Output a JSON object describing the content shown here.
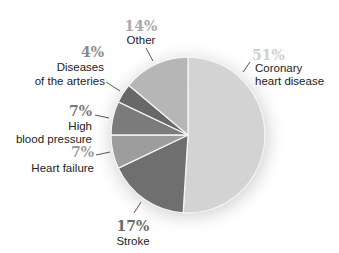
{
  "chart_data": {
    "type": "pie",
    "title": "",
    "start_angle_deg": 0,
    "direction": "clockwise",
    "slices": [
      {
        "label": "Coronary heart disease",
        "value": 51,
        "pct_text": "51%",
        "color": "#d3d3d3",
        "pct_color": "#cfcfcf"
      },
      {
        "label": "Stroke",
        "value": 17,
        "pct_text": "17%",
        "color": "#6f6f6f",
        "pct_color": "#6a6a6a"
      },
      {
        "label": "Heart failure",
        "value": 7,
        "pct_text": "7%",
        "color": "#9d9d9d",
        "pct_color": "#9a9a9a"
      },
      {
        "label": "High blood pressure",
        "value": 7,
        "pct_text": "7%",
        "color": "#7b7b7b",
        "pct_color": "#777777"
      },
      {
        "label": "Diseases of the arteries",
        "value": 4,
        "pct_text": "4%",
        "color": "#686868",
        "pct_color": "#8a8a8a"
      },
      {
        "label": "Other",
        "value": 14,
        "pct_text": "14%",
        "color": "#b6b6b6",
        "pct_color": "#a8a8a8"
      }
    ]
  },
  "labels": {
    "coronary": {
      "pct": "51%",
      "line1": "Coronary",
      "line2": "heart disease"
    },
    "stroke": {
      "pct": "17%",
      "line1": "Stroke"
    },
    "heart_failure": {
      "pct": "7%",
      "line1": "Heart failure"
    },
    "high_bp": {
      "pct": "7%",
      "line1": "High",
      "line2": "blood pressure"
    },
    "arteries": {
      "pct": "4%",
      "line1": "Diseases",
      "line2": "of the arteries"
    },
    "other": {
      "pct": "14%",
      "line1": "Other"
    }
  }
}
